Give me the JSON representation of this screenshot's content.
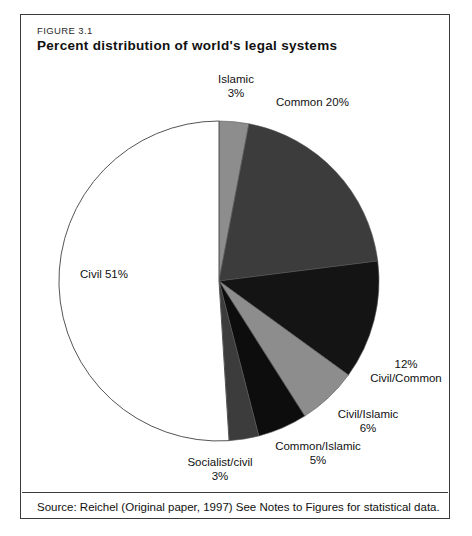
{
  "figure": {
    "number": "FIGURE 3.1",
    "title": "Percent distribution of world's legal systems",
    "source": "Source: Reichel (Original paper, 1997) See Notes to Figures for statistical data."
  },
  "chart_data": {
    "type": "pie",
    "title": "Percent distribution of world's legal systems",
    "unit": "percent",
    "start_angle_deg": 0,
    "direction": "clockwise",
    "legend": "none (direct labels)",
    "categories": [
      "Islamic",
      "Common",
      "Civil/Common",
      "Civil/Islamic",
      "Common/Islamic",
      "Socialist/civil",
      "Civil"
    ],
    "values": [
      3,
      20,
      12,
      6,
      5,
      3,
      51
    ],
    "slices": [
      {
        "name": "Islamic",
        "value": 3,
        "label_line1": "Islamic",
        "label_line2": "3%",
        "color": "#8d8d8d"
      },
      {
        "name": "Common",
        "value": 20,
        "label_line1": "Common   20%",
        "label_line2": "",
        "color": "#3c3c3c"
      },
      {
        "name": "Civil/Common",
        "value": 12,
        "label_line1": "12%",
        "label_line2": "Civil/Common",
        "color": "#141414"
      },
      {
        "name": "Civil/Islamic",
        "value": 6,
        "label_line1": "Civil/Islamic",
        "label_line2": "6%",
        "color": "#8d8d8d"
      },
      {
        "name": "Common/Islamic",
        "value": 5,
        "label_line1": "Common/Islamic",
        "label_line2": "5%",
        "color": "#0d0d0d"
      },
      {
        "name": "Socialist/civil",
        "value": 3,
        "label_line1": "Socialist/civil",
        "label_line2": "3%",
        "color": "#3c3c3c"
      },
      {
        "name": "Civil",
        "value": 51,
        "label_line1": "Civil  51%",
        "label_line2": "",
        "color": "#ffffff"
      }
    ],
    "outline_color": "#555555",
    "background": "#ffffff"
  }
}
